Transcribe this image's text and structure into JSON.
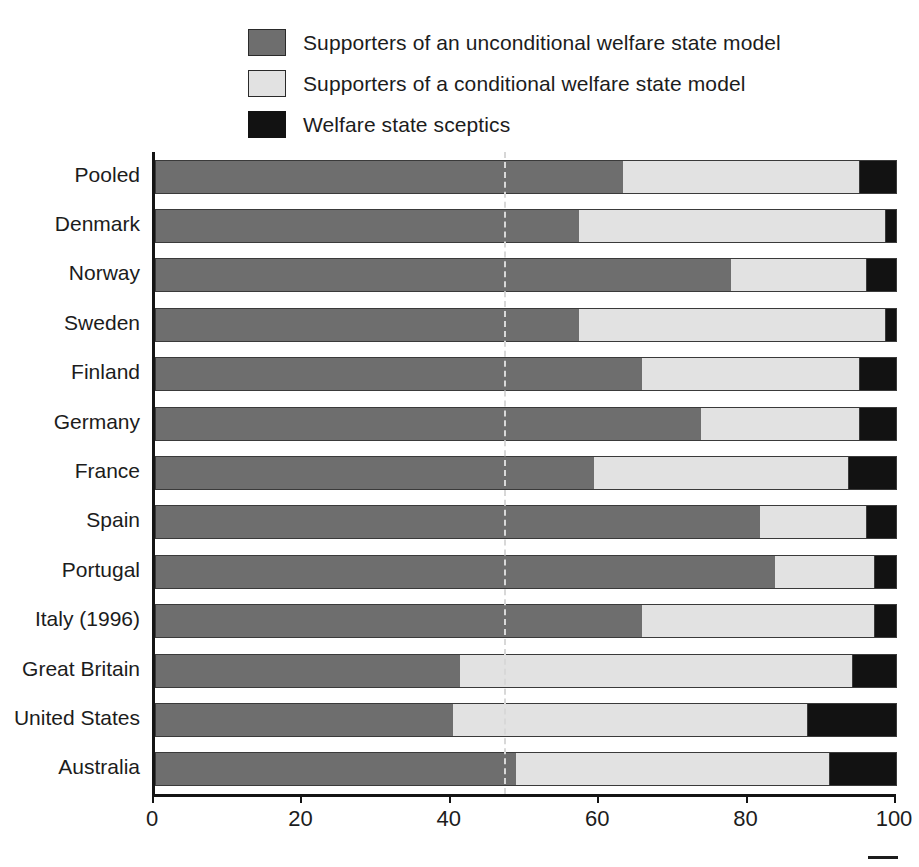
{
  "chart_data": {
    "type": "bar",
    "orientation": "horizontal",
    "stacked": true,
    "normalized_percent": true,
    "title": "",
    "subtitle": "",
    "xlabel": "",
    "ylabel": "",
    "xlim": [
      0,
      100
    ],
    "xticks": [
      0,
      20,
      40,
      60,
      80,
      100
    ],
    "xticklabels": [
      "0",
      "20",
      "40",
      "60",
      "80",
      "100"
    ],
    "grid": false,
    "legend_position": "top",
    "reference_line": {
      "value": 47,
      "style": "dashed",
      "color": "#d8d8d8"
    },
    "categories": [
      "Pooled",
      "Denmark",
      "Norway",
      "Sweden",
      "Finland",
      "Germany",
      "France",
      "Spain",
      "Portugal",
      "Italy (1996)",
      "Great Britain",
      "United States",
      "Australia"
    ],
    "series": [
      {
        "name": "Supporters of an unconditional welfare state model",
        "color": "#6e6e6e",
        "values": [
          63,
          57,
          77.5,
          57,
          65.5,
          73.5,
          59,
          81.5,
          83.5,
          65.5,
          41,
          40,
          48.5
        ]
      },
      {
        "name": "Supporters of a conditional welfare state model",
        "color": "#e2e2e2",
        "values": [
          32,
          41.5,
          18.5,
          41.5,
          29.5,
          21.5,
          34.5,
          14.5,
          13.5,
          31.5,
          53,
          48,
          42.5
        ]
      },
      {
        "name": "Welfare state sceptics",
        "color": "#121212",
        "values": [
          5,
          1.5,
          4,
          1.5,
          5,
          5,
          6.5,
          4,
          3,
          3,
          6,
          12,
          9
        ]
      }
    ]
  },
  "legend": {
    "items": [
      {
        "label": "Supporters of an unconditional welfare state model",
        "swatch": "dark-gray-swatch",
        "color": "#6e6e6e"
      },
      {
        "label": "Supporters of a conditional welfare state model",
        "swatch": "light-gray-swatch",
        "color": "#e2e2e2"
      },
      {
        "label": "Welfare state sceptics",
        "swatch": "black-swatch",
        "color": "#121212"
      }
    ]
  },
  "colors": {
    "unconditional": "#6e6e6e",
    "conditional": "#e2e2e2",
    "sceptics": "#121212",
    "axis": "#141414",
    "text": "#1c1c1c",
    "background": "#ffffff"
  }
}
